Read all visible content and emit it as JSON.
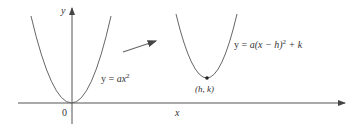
{
  "figure": {
    "axes": {
      "x_label": "x",
      "y_label": "y",
      "origin_label": "0"
    },
    "curves": [
      {
        "name": "base-parabola",
        "equation_prefix": "y = ",
        "equation_a": "ax",
        "equation_exp": "2"
      },
      {
        "name": "shifted-parabola",
        "equation_prefix": "y = ",
        "equation_body": "a(x − h)",
        "equation_exp": "2",
        "equation_suffix": " + k"
      }
    ],
    "vertex_label": "(h, k)",
    "colors": {
      "stroke": "#555555",
      "text": "#333333",
      "arrow": "#666666"
    }
  }
}
